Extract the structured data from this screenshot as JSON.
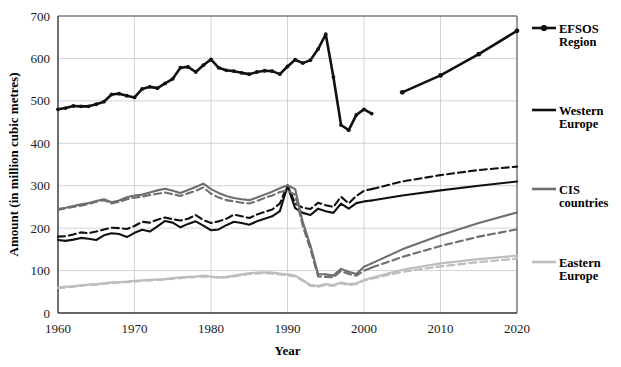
{
  "chart_data": {
    "type": "line",
    "title": "",
    "xlabel": "Year",
    "ylabel": "Amount (in million cubic metres)",
    "xlim": [
      1960,
      2020
    ],
    "ylim": [
      0,
      700
    ],
    "xticks": [
      "1960",
      "1970",
      "1980",
      "1990",
      "2000",
      "2010",
      "2020"
    ],
    "yticks": [
      "0",
      "100",
      "200",
      "300",
      "400",
      "500",
      "600",
      "700"
    ],
    "grid": "horizontal-and-vertical",
    "legend_position": "right",
    "colors": {
      "efsos": "#111111",
      "western_europe": "#111111",
      "cis_countries": "#6e6e6e",
      "eastern_europe": "#bdbdbd",
      "grid": "#c8c8c8",
      "axis": "#555555",
      "background": "#ffffff"
    },
    "legend": [
      {
        "label_line1": "EFSOS",
        "label_line2": "Region",
        "name": "EFSOS Region",
        "style": "solid-with-markers",
        "color": "#111111"
      },
      {
        "label_line1": "Western",
        "label_line2": "Europe",
        "name": "Western Europe",
        "style": "solid",
        "color": "#111111"
      },
      {
        "label_line1": "CIS",
        "label_line2": "countries",
        "name": "CIS countries",
        "style": "solid",
        "color": "#6e6e6e"
      },
      {
        "label_line1": "Eastern",
        "label_line2": "Europe",
        "name": "Eastern Europe",
        "style": "solid",
        "color": "#bdbdbd"
      }
    ],
    "x": [
      1960,
      1961,
      1962,
      1963,
      1964,
      1965,
      1966,
      1967,
      1968,
      1969,
      1970,
      1971,
      1972,
      1973,
      1974,
      1975,
      1976,
      1977,
      1978,
      1979,
      1980,
      1981,
      1982,
      1983,
      1984,
      1985,
      1986,
      1987,
      1988,
      1989,
      1990,
      1991,
      1992,
      1993,
      1994,
      1995,
      1996,
      1997,
      1998,
      1999,
      2000,
      2001
    ],
    "series": [
      {
        "name": "EFSOS Region",
        "style": "solid-with-markers",
        "color": "#111111",
        "values": [
          480,
          483,
          488,
          487,
          487,
          492,
          498,
          515,
          517,
          512,
          508,
          528,
          533,
          530,
          541,
          552,
          578,
          580,
          568,
          584,
          598,
          578,
          572,
          570,
          566,
          563,
          568,
          571,
          570,
          563,
          581,
          597,
          589,
          596,
          622,
          657,
          556,
          443,
          431,
          467,
          480,
          470
        ],
        "projection_x": [
          1990,
          1995,
          2000,
          2005,
          2010,
          2015,
          2020
        ],
        "projection_values": [
          null,
          null,
          null,
          520,
          560,
          610,
          665
        ]
      },
      {
        "name": "Western Europe (solid / historical + projection)",
        "style": "solid",
        "color": "#111111",
        "values": [
          172,
          170,
          173,
          177,
          175,
          172,
          183,
          188,
          186,
          179,
          189,
          196,
          192,
          204,
          217,
          213,
          202,
          210,
          216,
          206,
          195,
          197,
          207,
          215,
          212,
          208,
          216,
          222,
          228,
          240,
          299,
          247,
          236,
          231,
          246,
          240,
          236,
          258,
          246,
          259,
          263,
          265
        ],
        "projection_x": [
          2001,
          2005,
          2010,
          2015,
          2020
        ],
        "projection_values": [
          265,
          277,
          289,
          300,
          310
        ]
      },
      {
        "name": "Western Europe (dashed scenario)",
        "style": "dashed",
        "color": "#111111",
        "values": [
          180,
          181,
          185,
          190,
          188,
          192,
          197,
          201,
          200,
          198,
          205,
          215,
          213,
          220,
          225,
          221,
          218,
          222,
          231,
          219,
          212,
          216,
          222,
          232,
          228,
          224,
          232,
          238,
          244,
          258,
          301,
          258,
          248,
          245,
          260,
          254,
          250,
          274,
          258,
          276,
          288,
          292
        ],
        "projection_x": [
          2001,
          2005,
          2010,
          2015,
          2020
        ],
        "projection_values": [
          292,
          310,
          325,
          337,
          345
        ]
      },
      {
        "name": "CIS countries (solid)",
        "style": "solid",
        "color": "#6e6e6e",
        "values": [
          245,
          248,
          252,
          256,
          259,
          264,
          268,
          261,
          265,
          273,
          277,
          279,
          284,
          289,
          293,
          288,
          283,
          290,
          297,
          305,
          292,
          283,
          276,
          271,
          268,
          266,
          272,
          279,
          286,
          294,
          301,
          292,
          214,
          159,
          92,
          91,
          88,
          104,
          97,
          92,
          109,
          117
        ],
        "projection_x": [
          2001,
          2005,
          2010,
          2015,
          2020
        ],
        "projection_values": [
          117,
          150,
          183,
          212,
          237
        ]
      },
      {
        "name": "CIS countries (dashed scenario)",
        "style": "dashed",
        "color": "#6e6e6e",
        "values": [
          243,
          247,
          250,
          253,
          257,
          262,
          266,
          258,
          262,
          268,
          272,
          274,
          278,
          281,
          284,
          280,
          276,
          282,
          288,
          296,
          281,
          272,
          266,
          263,
          260,
          258,
          264,
          271,
          277,
          285,
          289,
          278,
          205,
          150,
          86,
          85,
          84,
          99,
          92,
          88,
          100,
          107
        ],
        "projection_x": [
          2001,
          2005,
          2010,
          2015,
          2020
        ],
        "projection_values": [
          107,
          132,
          158,
          180,
          197
        ]
      },
      {
        "name": "Eastern Europe (solid)",
        "style": "solid",
        "color": "#bdbdbd",
        "values": [
          60,
          62,
          63,
          65,
          67,
          68,
          70,
          72,
          73,
          74,
          76,
          77,
          78,
          79,
          80,
          82,
          84,
          85,
          86,
          88,
          86,
          84,
          85,
          88,
          91,
          94,
          95,
          96,
          95,
          93,
          91,
          88,
          78,
          66,
          64,
          68,
          66,
          72,
          68,
          70,
          78,
          83
        ],
        "projection_x": [
          2001,
          2005,
          2010,
          2015,
          2020
        ],
        "projection_values": [
          83,
          102,
          117,
          127,
          135
        ]
      },
      {
        "name": "Eastern Europe (dashed scenario)",
        "style": "dashed",
        "color": "#bdbdbd",
        "values": [
          59,
          60,
          62,
          64,
          66,
          67,
          69,
          70,
          72,
          73,
          74,
          76,
          77,
          78,
          79,
          81,
          82,
          84,
          85,
          86,
          85,
          83,
          84,
          86,
          89,
          92,
          93,
          94,
          93,
          91,
          89,
          86,
          76,
          64,
          62,
          66,
          64,
          70,
          66,
          68,
          76,
          81
        ],
        "projection_x": [
          2001,
          2005,
          2010,
          2015,
          2020
        ],
        "projection_values": [
          81,
          97,
          110,
          120,
          128
        ]
      }
    ],
    "annotations": {
      "note": "Solid lines to ~2000 are historical; lines past 2001 are projections to 2020"
    }
  }
}
